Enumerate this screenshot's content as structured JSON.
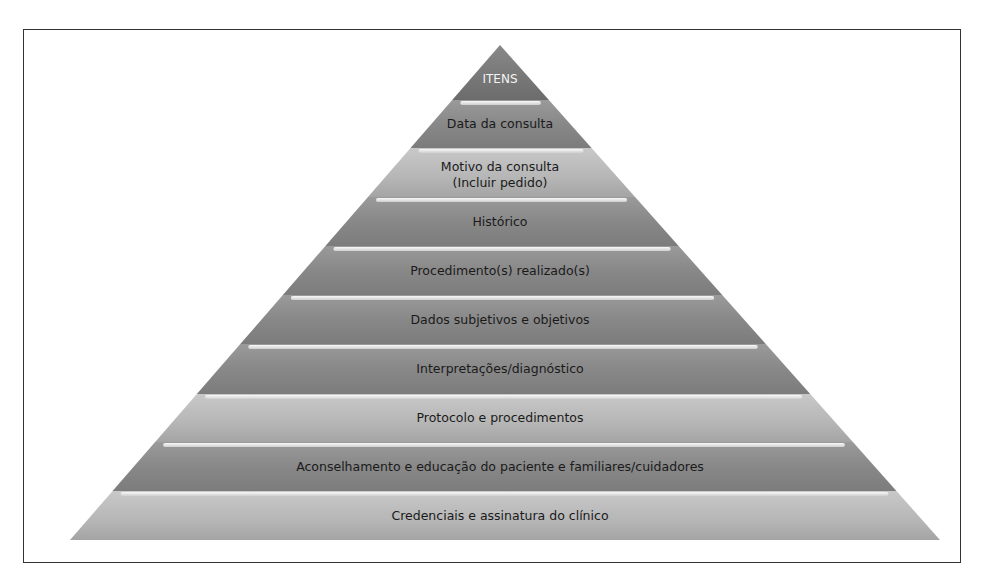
{
  "diagram": {
    "type": "pyramid",
    "layers": [
      {
        "label": "ITENS",
        "shade": "dark"
      },
      {
        "label": "Data da consulta",
        "shade": "mid"
      },
      {
        "label": "Motivo da consulta",
        "label2": "(Incluir pedido)",
        "shade": "light"
      },
      {
        "label": "Histórico",
        "shade": "mid"
      },
      {
        "label": "Procedimento(s) realizado(s)",
        "shade": "mid"
      },
      {
        "label": "Dados subjetivos e objetivos",
        "shade": "mid"
      },
      {
        "label": "Interpretações/diagnóstico",
        "shade": "mid"
      },
      {
        "label": "Protocolo e procedimentos",
        "shade": "light"
      },
      {
        "label": "Aconselhamento e educação do paciente e familiares/cuidadores",
        "shade": "mid"
      },
      {
        "label": "Credenciais e assinatura do clínico",
        "shade": "light"
      }
    ],
    "colors": {
      "dark": "#7a7a7a",
      "mid": "#8f8f8f",
      "light": "#b8b8b8",
      "highlight": "#efefef",
      "border": "#333333"
    }
  }
}
